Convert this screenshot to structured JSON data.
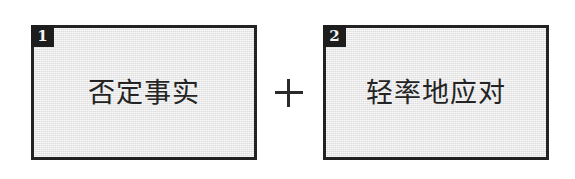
{
  "diagram": {
    "type": "two-factor-combination",
    "background_color": "#ffffff",
    "box_fill_color": "#e7e7e7",
    "box_border_color": "#232323",
    "badge_color": "#1d1d1d",
    "text_color": "#242424",
    "boxes": [
      {
        "badge": "1",
        "label": "否定事实"
      },
      {
        "badge": "2",
        "label": "轻率地应对"
      }
    ],
    "connector": {
      "symbol": "+",
      "name": "plus-sign"
    }
  }
}
